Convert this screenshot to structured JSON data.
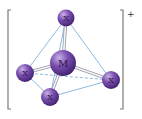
{
  "diagram": {
    "charge": "+",
    "central_atom": {
      "id": "M",
      "label": "M"
    },
    "ligands": [
      {
        "id": "x-top",
        "label": "X"
      },
      {
        "id": "x-left",
        "label": "X"
      },
      {
        "id": "x-bottom",
        "label": "X"
      },
      {
        "id": "x-right",
        "label": "X"
      }
    ],
    "bonds": [
      {
        "from": "M",
        "to": "x-top"
      },
      {
        "from": "M",
        "to": "x-left"
      },
      {
        "from": "M",
        "to": "x-bottom"
      },
      {
        "from": "M",
        "to": "x-right"
      }
    ],
    "edges": [
      {
        "from": "x-top",
        "to": "x-left",
        "style": "solid"
      },
      {
        "from": "x-top",
        "to": "x-bottom",
        "style": "solid"
      },
      {
        "from": "x-top",
        "to": "x-right",
        "style": "solid"
      },
      {
        "from": "x-left",
        "to": "x-bottom",
        "style": "solid"
      },
      {
        "from": "x-bottom",
        "to": "x-right",
        "style": "solid"
      },
      {
        "from": "x-left",
        "to": "x-right",
        "style": "dashed"
      }
    ],
    "colors": {
      "atom_fill": "#6a3d9a",
      "atom_highlight": "#c7b3e6",
      "edge": "#6fa8dc",
      "bracket": "#7a7a7a"
    }
  }
}
